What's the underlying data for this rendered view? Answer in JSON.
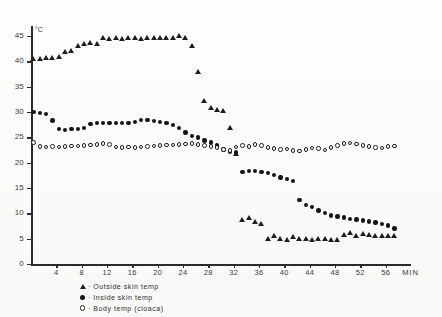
{
  "figure": {
    "unit_label": "°C",
    "x_axis_name": "MIN"
  },
  "legend": {
    "separator": "·",
    "items": [
      {
        "marker": "triangle-marker",
        "label": "Outside  skin  temp"
      },
      {
        "marker": "filled-circle-marker",
        "label": "Inside  skin  temp"
      },
      {
        "marker": "open-circle-marker",
        "label": "Body  temp  (cloaca)"
      }
    ]
  },
  "chart_data": {
    "type": "scatter",
    "title": "",
    "xlabel": "MIN",
    "ylabel": "°C",
    "xlim": [
      0,
      60
    ],
    "ylim": [
      0,
      47
    ],
    "grid": false,
    "legend_position": "below-axis-left",
    "xticks": [
      4,
      8,
      12,
      16,
      20,
      24,
      28,
      32,
      36,
      40,
      44,
      48,
      52,
      56
    ],
    "yticks": [
      0,
      5,
      10,
      15,
      20,
      25,
      30,
      35,
      40,
      45
    ],
    "series": [
      {
        "name": "Outside  skin  temp",
        "marker": "triangle",
        "x": [
          0.4,
          1.4,
          2.4,
          3.4,
          4.4,
          5.4,
          6.4,
          7.4,
          8.4,
          9.4,
          10.4,
          11.4,
          12.4,
          13.4,
          14.4,
          15.4,
          16.4,
          17.4,
          18.4,
          19.4,
          20.4,
          21.4,
          22.4,
          23.4,
          24.4,
          25.4,
          26.4,
          27.4,
          28.4,
          29.4,
          30.4,
          31.4,
          32.4,
          33.4,
          34.4,
          35.4,
          36.4,
          37.4,
          38.4,
          39.4,
          40.4,
          41.4,
          42.4,
          43.4,
          44.4,
          45.4,
          46.4,
          47.4,
          48.4,
          49.4,
          50.4,
          51.4,
          52.4,
          53.4,
          54.4,
          55.4,
          56.4,
          57.4
        ],
        "y": [
          40.0,
          40.0,
          40.2,
          40.3,
          40.4,
          41.4,
          41.6,
          42.7,
          43.0,
          43.2,
          43.1,
          44.2,
          44.0,
          44.1,
          43.9,
          44.1,
          44.2,
          43.9,
          44.2,
          44.1,
          44.1,
          44.2,
          44.2,
          44.6,
          44.1,
          42.6,
          37.5,
          31.8,
          30.4,
          30.0,
          29.8,
          26.5,
          21.2,
          8.2,
          8.6,
          7.8,
          7.4,
          4.6,
          5.0,
          4.5,
          4.4,
          4.8,
          4.6,
          4.5,
          4.4,
          4.6,
          4.5,
          4.4,
          4.3,
          5.2,
          5.6,
          5.1,
          5.4,
          5.2,
          5.0,
          5.1,
          5.0,
          5.1
        ]
      },
      {
        "name": "Inside  skin  temp",
        "marker": "filled-circle",
        "x": [
          0.4,
          1.4,
          2.4,
          3.4,
          4.4,
          5.4,
          6.4,
          7.4,
          8.4,
          9.4,
          10.4,
          11.4,
          12.4,
          13.4,
          14.4,
          15.4,
          16.4,
          17.4,
          18.4,
          19.4,
          20.4,
          21.4,
          22.4,
          23.4,
          24.4,
          25.4,
          26.4,
          27.4,
          28.4,
          29.4,
          30.4,
          31.4,
          32.4,
          33.4,
          34.4,
          35.4,
          36.4,
          37.4,
          38.4,
          39.4,
          40.4,
          41.4,
          42.4,
          43.4,
          44.4,
          45.4,
          46.4,
          47.4,
          48.4,
          49.4,
          50.4,
          51.4,
          52.4,
          53.4,
          54.4,
          55.4,
          56.4,
          57.4
        ],
        "y": [
          30.0,
          29.8,
          29.6,
          28.3,
          26.6,
          26.5,
          26.6,
          26.7,
          26.9,
          27.6,
          27.8,
          27.8,
          27.8,
          27.9,
          27.9,
          27.8,
          28.0,
          28.4,
          28.4,
          28.2,
          28.0,
          27.8,
          27.4,
          26.8,
          26.0,
          25.3,
          25.0,
          24.4,
          24.0,
          23.4,
          22.6,
          22.2,
          22.0,
          18.2,
          18.4,
          18.4,
          18.2,
          18.0,
          17.6,
          17.1,
          16.8,
          16.4,
          12.6,
          11.7,
          11.2,
          10.6,
          10.1,
          9.6,
          9.4,
          9.2,
          8.9,
          8.8,
          8.6,
          8.4,
          8.2,
          7.9,
          7.6,
          7.0
        ]
      },
      {
        "name": "Body  temp  (cloaca)",
        "marker": "open-circle",
        "x": [
          0.4,
          1.4,
          2.4,
          3.4,
          4.4,
          5.4,
          6.4,
          7.4,
          8.4,
          9.4,
          10.4,
          11.4,
          12.4,
          13.4,
          14.4,
          15.4,
          16.4,
          17.4,
          18.4,
          19.4,
          20.4,
          21.4,
          22.4,
          23.4,
          24.4,
          25.4,
          26.4,
          27.4,
          28.4,
          29.4,
          30.4,
          31.4,
          32.4,
          33.4,
          34.4,
          35.4,
          36.4,
          37.4,
          38.4,
          39.4,
          40.4,
          41.4,
          42.4,
          43.4,
          44.4,
          45.4,
          46.4,
          47.4,
          48.4,
          49.4,
          50.4,
          51.4,
          52.4,
          53.4,
          54.4,
          55.4,
          56.4,
          57.4
        ],
        "y": [
          24.0,
          23.2,
          23.1,
          23.2,
          23.1,
          23.2,
          23.3,
          23.3,
          23.4,
          23.5,
          23.6,
          23.8,
          23.6,
          23.1,
          23.0,
          23.1,
          23.0,
          23.1,
          23.2,
          23.3,
          23.4,
          23.5,
          23.5,
          23.6,
          23.7,
          23.8,
          23.6,
          23.4,
          23.2,
          23.0,
          22.6,
          22.4,
          23.1,
          23.4,
          23.2,
          23.6,
          23.4,
          23.0,
          22.8,
          22.6,
          22.7,
          22.4,
          22.3,
          22.6,
          22.9,
          22.8,
          22.5,
          23.0,
          23.4,
          23.8,
          23.9,
          23.7,
          23.4,
          23.2,
          23.0,
          22.9,
          23.2,
          23.3
        ]
      }
    ]
  }
}
